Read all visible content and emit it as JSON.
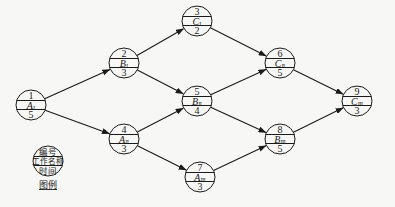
{
  "diagram": {
    "type": "activity-on-node network diagram",
    "colors": {
      "line": "#1a1a1a",
      "background": "#f7f7f5"
    },
    "nodes": [
      {
        "id": "1",
        "number": "1",
        "name": "A",
        "sub": "Ⅰ",
        "duration": "5",
        "cx": 31,
        "cy": 105
      },
      {
        "id": "2",
        "number": "2",
        "name": "B",
        "sub": "Ⅰ",
        "duration": "3",
        "cx": 124,
        "cy": 63
      },
      {
        "id": "3",
        "number": "3",
        "name": "C",
        "sub": "Ⅰ",
        "duration": "2",
        "cx": 197,
        "cy": 21
      },
      {
        "id": "4",
        "number": "4",
        "name": "A",
        "sub": "Ⅱ",
        "duration": "3",
        "cx": 124,
        "cy": 139
      },
      {
        "id": "5",
        "number": "5",
        "name": "B",
        "sub": "Ⅱ",
        "duration": "4",
        "cx": 197,
        "cy": 101
      },
      {
        "id": "6",
        "number": "6",
        "name": "C",
        "sub": "Ⅱ",
        "duration": "5",
        "cx": 280,
        "cy": 63
      },
      {
        "id": "7",
        "number": "7",
        "name": "A",
        "sub": "Ⅲ",
        "duration": "3",
        "cx": 200,
        "cy": 177
      },
      {
        "id": "8",
        "number": "8",
        "name": "B",
        "sub": "Ⅲ",
        "duration": "5",
        "cx": 280,
        "cy": 139
      },
      {
        "id": "9",
        "number": "9",
        "name": "C",
        "sub": "Ⅲ",
        "duration": "3",
        "cx": 357,
        "cy": 101
      }
    ],
    "edges": [
      {
        "from": "1",
        "to": "2"
      },
      {
        "from": "1",
        "to": "4"
      },
      {
        "from": "2",
        "to": "3"
      },
      {
        "from": "2",
        "to": "5"
      },
      {
        "from": "4",
        "to": "5"
      },
      {
        "from": "4",
        "to": "7"
      },
      {
        "from": "3",
        "to": "6"
      },
      {
        "from": "5",
        "to": "6"
      },
      {
        "from": "5",
        "to": "8"
      },
      {
        "from": "7",
        "to": "8"
      },
      {
        "from": "6",
        "to": "9"
      },
      {
        "from": "8",
        "to": "9"
      }
    ],
    "legend": {
      "top": "编号",
      "middle": "工作名称",
      "bottom": "时间",
      "caption": "图例",
      "cx": 48,
      "cy": 161
    }
  }
}
